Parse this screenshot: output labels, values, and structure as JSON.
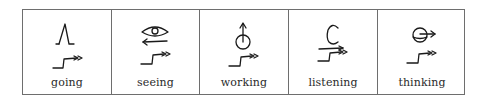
{
  "figure": {
    "type": "symbol-table",
    "border_color": "#6e6e6e",
    "cells": [
      {
        "label": "going",
        "symbol": "walking-legs-with-action-indicator-icon"
      },
      {
        "label": "seeing",
        "symbol": "eye-with-arrow-and-action-indicator-icon"
      },
      {
        "label": "working",
        "symbol": "circle-with-up-arrow-and-action-indicator-icon"
      },
      {
        "label": "listening",
        "symbol": "ear-with-arrow-and-action-indicator-icon"
      },
      {
        "label": "thinking",
        "symbol": "head-with-arrow-and-action-indicator-icon"
      }
    ]
  }
}
